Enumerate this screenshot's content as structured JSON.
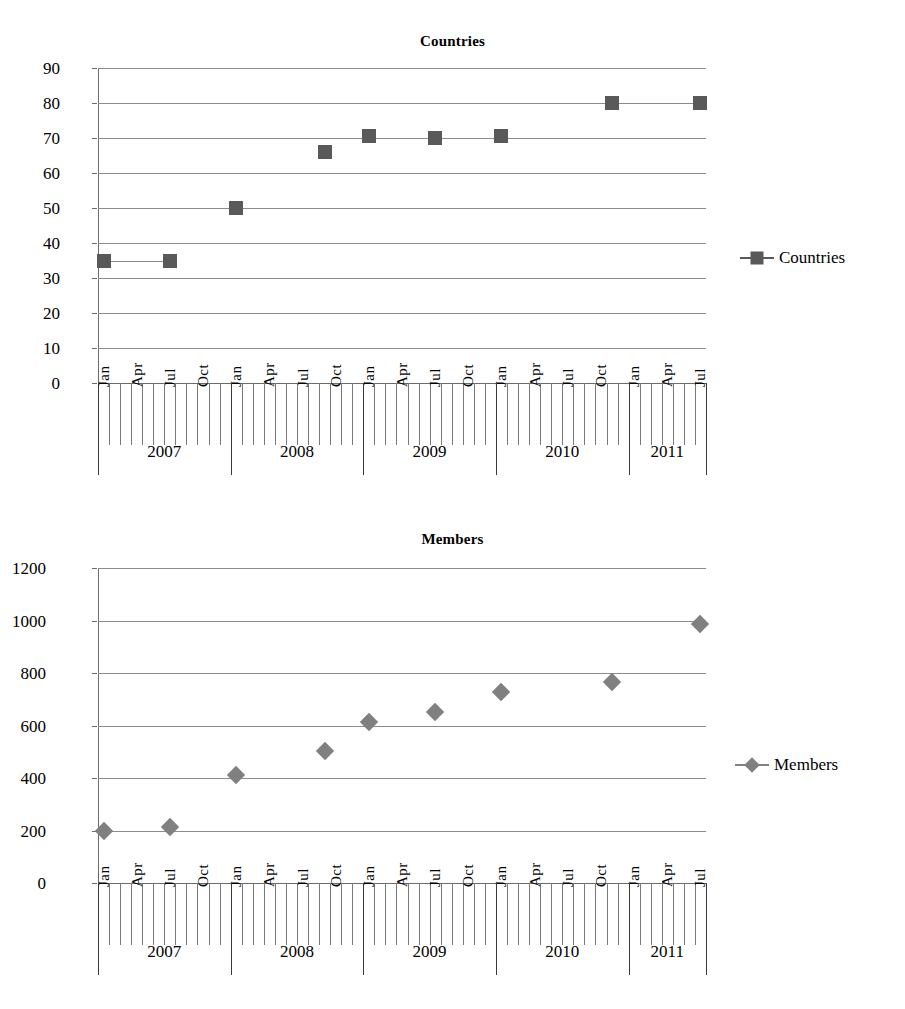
{
  "page": {
    "background": "#ffffff",
    "axis_color": "#6b6b6b",
    "grid_color": "#8c8c8c"
  },
  "charts": [
    {
      "id": "countries",
      "title": "Countries",
      "legend_label": "Countries",
      "marker": "square",
      "marker_color": "#595959",
      "line_color": "#8a8a8a"
    },
    {
      "id": "members",
      "title": "Members",
      "legend_label": "Members",
      "marker": "diamond",
      "marker_color": "#808080",
      "line_color": "#9a9a9a"
    }
  ],
  "chart_data": [
    {
      "type": "scatter",
      "title": "Countries",
      "xlabel": "",
      "ylabel": "",
      "ylim": [
        0,
        90
      ],
      "ytick_step": 10,
      "ytick_labels": [
        "0",
        "10",
        "20",
        "30",
        "40",
        "50",
        "60",
        "70",
        "80",
        "90"
      ],
      "grid": true,
      "legend": [
        "Countries"
      ],
      "legend_position": "right",
      "x_axis": {
        "type": "monthly",
        "start": "2007-01",
        "end": "2011-07",
        "labeled_months": [
          "Jan",
          "Apr",
          "Jul",
          "Oct"
        ],
        "month_labels": [
          "Jan",
          "Apr",
          "Jul",
          "Oct",
          "Jan",
          "Apr",
          "Jul",
          "Oct",
          "Jan",
          "Apr",
          "Jul",
          "Oct",
          "Jan",
          "Apr",
          "Jul",
          "Oct",
          "Jan",
          "Apr",
          "Jul"
        ],
        "years": [
          "2007",
          "2008",
          "2009",
          "2010",
          "2011"
        ]
      },
      "series": [
        {
          "name": "Countries",
          "points": [
            {
              "x": "2007-01",
              "month_index": 0,
              "y": 35
            },
            {
              "x": "2007-07",
              "month_index": 6,
              "y": 35
            },
            {
              "x": "2008-01",
              "month_index": 12,
              "y": 50
            },
            {
              "x": "2008-09",
              "month_index": 20,
              "y": 66
            },
            {
              "x": "2009-01",
              "month_index": 24,
              "y": 70.5
            },
            {
              "x": "2009-07",
              "month_index": 30,
              "y": 70
            },
            {
              "x": "2010-01",
              "month_index": 36,
              "y": 70.5
            },
            {
              "x": "2010-11",
              "month_index": 46,
              "y": 80
            },
            {
              "x": "2011-07",
              "month_index": 54,
              "y": 80
            }
          ]
        }
      ]
    },
    {
      "type": "scatter",
      "title": "Members",
      "xlabel": "",
      "ylabel": "",
      "ylim": [
        0,
        1200
      ],
      "ytick_step": 200,
      "ytick_labels": [
        "0",
        "200",
        "400",
        "600",
        "800",
        "1000",
        "1200"
      ],
      "grid": true,
      "legend": [
        "Members"
      ],
      "legend_position": "right",
      "x_axis": {
        "type": "monthly",
        "start": "2007-01",
        "end": "2011-07",
        "labeled_months": [
          "Jan",
          "Apr",
          "Jul",
          "Oct"
        ],
        "month_labels": [
          "Jan",
          "Apr",
          "Jul",
          "Oct",
          "Jan",
          "Apr",
          "Jul",
          "Oct",
          "Jan",
          "Apr",
          "Jul",
          "Oct",
          "Jan",
          "Apr",
          "Jul",
          "Oct",
          "Jan",
          "Apr",
          "Jul"
        ],
        "years": [
          "2007",
          "2008",
          "2009",
          "2010",
          "2011"
        ]
      },
      "series": [
        {
          "name": "Members",
          "points": [
            {
              "x": "2007-01",
              "month_index": 0,
              "y": 197
            },
            {
              "x": "2007-07",
              "month_index": 6,
              "y": 213
            },
            {
              "x": "2008-01",
              "month_index": 12,
              "y": 413
            },
            {
              "x": "2008-09",
              "month_index": 20,
              "y": 503
            },
            {
              "x": "2009-01",
              "month_index": 24,
              "y": 615
            },
            {
              "x": "2009-07",
              "month_index": 30,
              "y": 653
            },
            {
              "x": "2010-01",
              "month_index": 36,
              "y": 727
            },
            {
              "x": "2010-11",
              "month_index": 46,
              "y": 765
            },
            {
              "x": "2011-07",
              "month_index": 54,
              "y": 988
            }
          ]
        }
      ]
    }
  ]
}
